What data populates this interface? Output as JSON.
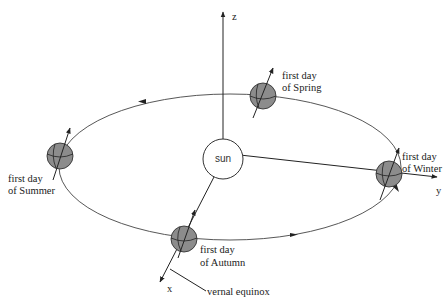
{
  "diagram": {
    "axes": {
      "z_label": "z",
      "y_label": "y",
      "x_label": "x"
    },
    "sun": {
      "label": "sun"
    },
    "positions": [
      {
        "id": "spring",
        "line1": "first day",
        "line2": "of Spring"
      },
      {
        "id": "summer",
        "line1": "first day",
        "line2": "of Summer"
      },
      {
        "id": "autumn",
        "line1": "first day",
        "line2": "of Autumn"
      },
      {
        "id": "winter",
        "line1": "first day",
        "line2": "of Winter"
      }
    ],
    "annotation": {
      "vernal_equinox": "vernal equinox"
    },
    "colors": {
      "planet_fill": "#8c8c8c",
      "line": "#222222",
      "background": "#ffffff"
    }
  }
}
